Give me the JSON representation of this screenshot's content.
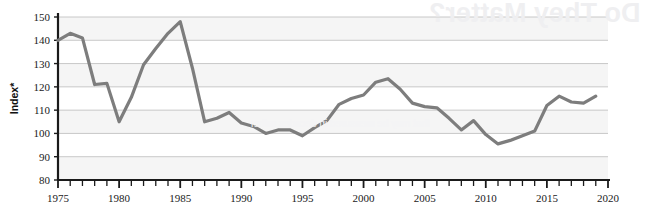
{
  "chart_data": {
    "type": "line",
    "title": "",
    "subtitle": "",
    "xlabel": "",
    "ylabel": "Index*",
    "xlim": [
      1975,
      2020
    ],
    "ylim": [
      80,
      150
    ],
    "y_ticks": [
      80,
      90,
      100,
      110,
      120,
      130,
      140,
      150
    ],
    "x_ticks": [
      1975,
      1980,
      1985,
      1990,
      1995,
      2000,
      2005,
      2010,
      2015,
      2020
    ],
    "x_tick_labels": [
      "1975",
      "1980",
      "1985",
      "1990",
      "1995",
      "2000",
      "2005",
      "2010",
      "2015",
      "2020"
    ],
    "y_tick_labels": [
      "80",
      "90",
      "100",
      "110",
      "120",
      "130",
      "140",
      "150"
    ],
    "x_minor_tick_interval": 1,
    "grid": true,
    "grid_axis": "y",
    "banded_background": true,
    "legend": null,
    "legend_position": "none",
    "line_color": "#7d7d7d",
    "line_width": 3.2,
    "markers": false,
    "x": [
      1975,
      1976,
      1977,
      1978,
      1979,
      1980,
      1981,
      1982,
      1983,
      1984,
      1985,
      1986,
      1987,
      1988,
      1989,
      1990,
      1991,
      1992,
      1993,
      1994,
      1995,
      1996,
      1997,
      1998,
      1999,
      2000,
      2001,
      2002,
      2003,
      2004,
      2005,
      2006,
      2007,
      2008,
      2009,
      2010,
      2011,
      2012,
      2013,
      2014,
      2015,
      2016,
      2017,
      2018,
      2019
    ],
    "values": [
      140.0,
      143.0,
      141.0,
      121.0,
      121.5,
      105.0,
      115.5,
      129.5,
      136.5,
      143.0,
      148.0,
      128.0,
      105.0,
      106.5,
      109.0,
      104.5,
      103.0,
      100.0,
      101.5,
      101.5,
      99.0,
      102.5,
      105.5,
      112.5,
      115.0,
      116.5,
      122.0,
      123.5,
      119.0,
      113.0,
      111.5,
      111.0,
      106.5,
      101.5,
      105.5,
      99.5,
      95.5,
      97.0,
      99.0,
      101.0,
      112.0,
      116.0,
      113.5,
      113.0,
      116.0
    ],
    "series": [
      {
        "name": "Index*",
        "color": "#7d7d7d",
        "values": [
          140.0,
          143.0,
          141.0,
          121.0,
          121.5,
          105.0,
          115.5,
          129.5,
          136.5,
          143.0,
          148.0,
          128.0,
          105.0,
          106.5,
          109.0,
          104.5,
          103.0,
          100.0,
          101.5,
          101.5,
          99.0,
          102.5,
          105.5,
          112.5,
          115.0,
          116.5,
          122.0,
          123.5,
          119.0,
          113.0,
          111.5,
          111.0,
          106.5,
          101.5,
          105.5,
          99.5,
          95.5,
          97.0,
          99.0,
          101.0,
          112.0,
          116.0,
          113.5,
          113.0,
          116.0
        ]
      }
    ],
    "annotations": []
  },
  "background_text": {
    "bleed_heading": "Do They Matter?",
    "bleed_body": "that may be measured in decades rather"
  },
  "colors": {
    "line": "#7d7d7d",
    "axis": "#1a1a1a",
    "gridline": "#c8c8c8",
    "band": "#f1f1f1",
    "background": "#ffffff",
    "text": "#111111"
  }
}
